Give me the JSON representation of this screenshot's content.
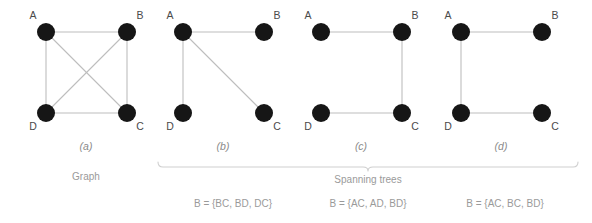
{
  "figure": {
    "title_hidden": "",
    "colors": {
      "node": "#161616",
      "edge": "#bdbdbd",
      "brace": "#cfcfcf",
      "text": "#8a8a8a",
      "vertex_text": "#4a4a4a",
      "background": "#ffffff"
    },
    "vertex_names": {
      "a": "A",
      "b": "B",
      "c": "C",
      "d": "D"
    },
    "panels": [
      {
        "id": "a",
        "letter": "(a)",
        "caption": "Graph",
        "set_label": "",
        "edges": [
          "AB",
          "AD",
          "BC",
          "DC",
          "AC",
          "BD"
        ]
      },
      {
        "id": "b",
        "letter": "(b)",
        "caption": "",
        "set_label": "B = {BC, BD, DC}",
        "edges": [
          "AB",
          "AD",
          "AC"
        ]
      },
      {
        "id": "c",
        "letter": "(c)",
        "caption": "",
        "set_label": "B = {AC, AD, BD}",
        "edges": [
          "AB",
          "BC",
          "DC"
        ]
      },
      {
        "id": "d",
        "letter": "(d)",
        "caption": "",
        "set_label": "B = {AC, BC, BD}",
        "edges": [
          "AB",
          "AD",
          "DC"
        ]
      }
    ],
    "group_brace_label": "Spanning trees"
  }
}
